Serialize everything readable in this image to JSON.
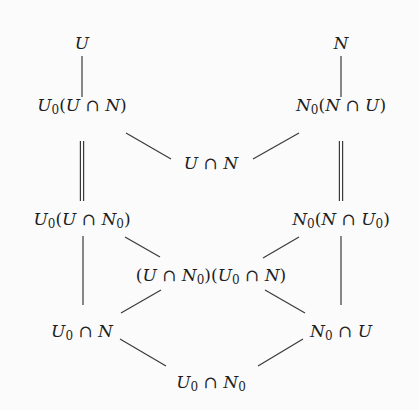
{
  "diagram": {
    "type": "lattice",
    "nodes": [
      {
        "id": "U",
        "label": "U",
        "x": 82,
        "y": 48
      },
      {
        "id": "N",
        "label": "N",
        "x": 341,
        "y": 48
      },
      {
        "id": "U0_UcapN",
        "label": "U₀(U ∩ N)",
        "x": 82,
        "y": 110
      },
      {
        "id": "N0_NcapU",
        "label": "N₀(N ∩ U)",
        "x": 341,
        "y": 110
      },
      {
        "id": "UcapN",
        "label": "U ∩ N",
        "x": 211,
        "y": 168
      },
      {
        "id": "U0_UcapN0",
        "label": "U₀(U ∩ N₀)",
        "x": 82,
        "y": 224
      },
      {
        "id": "N0_NcapU0",
        "label": "N₀(N ∩ U₀)",
        "x": 341,
        "y": 224
      },
      {
        "id": "middle",
        "label": "(U ∩ N₀)(U₀ ∩ N)",
        "x": 211,
        "y": 280
      },
      {
        "id": "U0capN",
        "label": "U₀ ∩ N",
        "x": 82,
        "y": 336
      },
      {
        "id": "N0capU",
        "label": "N₀ ∩ U",
        "x": 341,
        "y": 336
      },
      {
        "id": "U0capN0",
        "label": "U₀ ∩ N₀",
        "x": 211,
        "y": 387
      }
    ],
    "edges": [
      {
        "from": "U",
        "to": "U0_UcapN",
        "style": "single",
        "x1": 82,
        "y1": 56,
        "x2": 82,
        "y2": 97
      },
      {
        "from": "N",
        "to": "N0_NcapU",
        "style": "single",
        "x1": 341,
        "y1": 56,
        "x2": 341,
        "y2": 97
      },
      {
        "from": "U0_UcapN",
        "to": "UcapN",
        "style": "single",
        "x1": 126,
        "y1": 133,
        "x2": 171,
        "y2": 159
      },
      {
        "from": "N0_NcapU",
        "to": "UcapN",
        "style": "single",
        "x1": 299,
        "y1": 133,
        "x2": 253,
        "y2": 159
      },
      {
        "from": "U0_UcapN",
        "to": "U0_UcapN0",
        "style": "double",
        "x1": 82,
        "y1": 141,
        "x2": 82,
        "y2": 201
      },
      {
        "from": "N0_NcapU",
        "to": "N0_NcapU0",
        "style": "double",
        "x1": 341,
        "y1": 141,
        "x2": 341,
        "y2": 201
      },
      {
        "from": "U0_UcapN0",
        "to": "U0capN",
        "style": "single",
        "x1": 83,
        "y1": 236,
        "x2": 83,
        "y2": 305
      },
      {
        "from": "N0_NcapU0",
        "to": "N0capU",
        "style": "single",
        "x1": 341,
        "y1": 236,
        "x2": 341,
        "y2": 305
      },
      {
        "from": "U0_UcapN0",
        "to": "middle",
        "style": "single",
        "x1": 125,
        "y1": 237,
        "x2": 160,
        "y2": 257
      },
      {
        "from": "N0_NcapU0",
        "to": "middle",
        "style": "single",
        "x1": 299,
        "y1": 237,
        "x2": 263,
        "y2": 258
      },
      {
        "from": "middle",
        "to": "U0capN",
        "style": "single",
        "x1": 161,
        "y1": 290,
        "x2": 121,
        "y2": 313
      },
      {
        "from": "middle",
        "to": "N0capU",
        "style": "single",
        "x1": 265,
        "y1": 290,
        "x2": 305,
        "y2": 313
      },
      {
        "from": "U0capN",
        "to": "U0capN0",
        "style": "single",
        "x1": 120,
        "y1": 339,
        "x2": 166,
        "y2": 366
      },
      {
        "from": "N0capU",
        "to": "U0capN0",
        "style": "single",
        "x1": 303,
        "y1": 339,
        "x2": 258,
        "y2": 366
      }
    ],
    "colors": {
      "background": "#fbfbfb",
      "line": "#3a3a3a",
      "text": "#1e1e1e"
    }
  }
}
